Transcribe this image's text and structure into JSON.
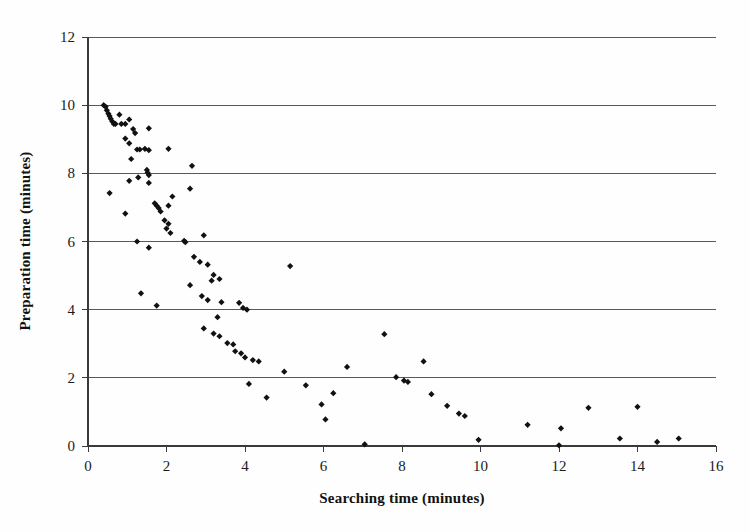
{
  "chart_data": {
    "type": "scatter",
    "title": "",
    "xlabel": "Searching time (minutes)",
    "ylabel": "Preparation time (minutes)",
    "xlim": [
      0,
      16
    ],
    "ylim": [
      0,
      12
    ],
    "xticks": [
      0,
      2,
      4,
      6,
      8,
      10,
      12,
      14,
      16
    ],
    "yticks": [
      0,
      2,
      4,
      6,
      8,
      10,
      12
    ],
    "grid": "horizontal",
    "legend": "none",
    "marker": "diamond",
    "marker_color": "#111111",
    "series": [
      {
        "name": "observations",
        "points": [
          [
            0.4,
            10.0
          ],
          [
            0.45,
            9.95
          ],
          [
            0.48,
            9.85
          ],
          [
            0.52,
            9.75
          ],
          [
            0.55,
            9.68
          ],
          [
            0.58,
            9.6
          ],
          [
            0.62,
            9.52
          ],
          [
            0.66,
            9.45
          ],
          [
            0.7,
            9.45
          ],
          [
            0.85,
            9.45
          ],
          [
            0.95,
            9.45
          ],
          [
            0.8,
            9.72
          ],
          [
            1.05,
            9.58
          ],
          [
            1.15,
            9.3
          ],
          [
            1.2,
            9.18
          ],
          [
            0.95,
            9.02
          ],
          [
            1.05,
            8.88
          ],
          [
            1.55,
            9.32
          ],
          [
            1.45,
            8.72
          ],
          [
            1.25,
            8.7
          ],
          [
            1.32,
            8.7
          ],
          [
            1.1,
            8.42
          ],
          [
            2.05,
            8.72
          ],
          [
            1.55,
            8.68
          ],
          [
            0.55,
            7.42
          ],
          [
            1.05,
            7.78
          ],
          [
            1.28,
            7.88
          ],
          [
            1.55,
            7.72
          ],
          [
            1.5,
            8.1
          ],
          [
            1.52,
            8.02
          ],
          [
            1.55,
            7.95
          ],
          [
            2.65,
            8.22
          ],
          [
            0.95,
            6.82
          ],
          [
            1.7,
            7.12
          ],
          [
            1.75,
            7.05
          ],
          [
            1.8,
            6.98
          ],
          [
            1.85,
            6.88
          ],
          [
            2.05,
            7.05
          ],
          [
            2.15,
            7.32
          ],
          [
            2.6,
            7.55
          ],
          [
            1.95,
            6.62
          ],
          [
            2.05,
            6.52
          ],
          [
            2.0,
            6.38
          ],
          [
            2.1,
            6.25
          ],
          [
            1.25,
            6.0
          ],
          [
            1.55,
            5.82
          ],
          [
            2.45,
            6.02
          ],
          [
            2.48,
            5.98
          ],
          [
            2.95,
            6.18
          ],
          [
            2.7,
            5.55
          ],
          [
            2.85,
            5.4
          ],
          [
            3.05,
            5.32
          ],
          [
            5.15,
            5.28
          ],
          [
            3.2,
            5.02
          ],
          [
            3.15,
            4.85
          ],
          [
            3.35,
            4.9
          ],
          [
            2.6,
            4.72
          ],
          [
            1.35,
            4.48
          ],
          [
            1.75,
            4.12
          ],
          [
            2.9,
            4.4
          ],
          [
            3.05,
            4.28
          ],
          [
            3.4,
            4.22
          ],
          [
            3.85,
            4.2
          ],
          [
            3.95,
            4.05
          ],
          [
            4.05,
            4.0
          ],
          [
            3.3,
            3.78
          ],
          [
            3.35,
            3.22
          ],
          [
            3.2,
            3.3
          ],
          [
            2.95,
            3.45
          ],
          [
            3.55,
            3.02
          ],
          [
            3.7,
            2.98
          ],
          [
            3.75,
            2.78
          ],
          [
            3.9,
            2.72
          ],
          [
            4.0,
            2.6
          ],
          [
            4.2,
            2.52
          ],
          [
            4.35,
            2.48
          ],
          [
            4.1,
            1.82
          ],
          [
            4.55,
            1.42
          ],
          [
            5.0,
            2.18
          ],
          [
            5.55,
            1.78
          ],
          [
            5.95,
            1.22
          ],
          [
            6.05,
            0.78
          ],
          [
            6.25,
            1.55
          ],
          [
            6.6,
            2.32
          ],
          [
            7.05,
            0.05
          ],
          [
            7.55,
            3.28
          ],
          [
            7.85,
            2.02
          ],
          [
            8.05,
            1.92
          ],
          [
            8.15,
            1.88
          ],
          [
            8.55,
            2.48
          ],
          [
            8.75,
            1.52
          ],
          [
            9.15,
            1.18
          ],
          [
            9.45,
            0.95
          ],
          [
            9.6,
            0.88
          ],
          [
            9.95,
            0.18
          ],
          [
            11.2,
            0.62
          ],
          [
            12.0,
            0.02
          ],
          [
            12.05,
            0.52
          ],
          [
            12.75,
            1.12
          ],
          [
            13.55,
            0.22
          ],
          [
            14.0,
            1.15
          ],
          [
            14.5,
            0.12
          ],
          [
            15.05,
            0.22
          ]
        ]
      }
    ]
  },
  "axes": {
    "x_title": "Searching time (minutes)",
    "y_title": "Preparation time (minutes)",
    "x_tick_labels": [
      "0",
      "2",
      "4",
      "6",
      "8",
      "10",
      "12",
      "14",
      "16"
    ],
    "y_tick_labels": [
      "0",
      "2",
      "4",
      "6",
      "8",
      "10",
      "12"
    ]
  },
  "colors": {
    "marker": "#111111",
    "gridline": "#595959",
    "axis": "#3a3a3a",
    "background": "#ffffff"
  }
}
